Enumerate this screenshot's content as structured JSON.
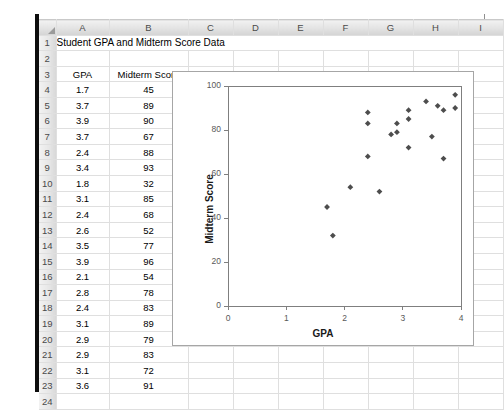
{
  "spreadsheet": {
    "column_headers": [
      "A",
      "B",
      "C",
      "D",
      "E",
      "F",
      "G",
      "H",
      "I"
    ],
    "row_headers": [
      "1",
      "2",
      "3",
      "4",
      "5",
      "6",
      "7",
      "8",
      "9",
      "10",
      "11",
      "12",
      "13",
      "14",
      "15",
      "16",
      "17",
      "18",
      "19",
      "20",
      "21",
      "22",
      "23",
      "24"
    ],
    "title_cell": "Student GPA and Midterm Score Data",
    "table_headers": [
      "GPA",
      "Midterm Score"
    ],
    "rows": [
      {
        "row": "4",
        "gpa": "1.7",
        "score": "45"
      },
      {
        "row": "5",
        "gpa": "3.7",
        "score": "89"
      },
      {
        "row": "6",
        "gpa": "3.9",
        "score": "90"
      },
      {
        "row": "7",
        "gpa": "3.7",
        "score": "67"
      },
      {
        "row": "8",
        "gpa": "2.4",
        "score": "88"
      },
      {
        "row": "9",
        "gpa": "3.4",
        "score": "93"
      },
      {
        "row": "10",
        "gpa": "1.8",
        "score": "32"
      },
      {
        "row": "11",
        "gpa": "3.1",
        "score": "85"
      },
      {
        "row": "12",
        "gpa": "2.4",
        "score": "68"
      },
      {
        "row": "13",
        "gpa": "2.6",
        "score": "52"
      },
      {
        "row": "14",
        "gpa": "3.5",
        "score": "77"
      },
      {
        "row": "15",
        "gpa": "3.9",
        "score": "96"
      },
      {
        "row": "16",
        "gpa": "2.1",
        "score": "54"
      },
      {
        "row": "17",
        "gpa": "2.8",
        "score": "78"
      },
      {
        "row": "18",
        "gpa": "2.4",
        "score": "83"
      },
      {
        "row": "19",
        "gpa": "3.1",
        "score": "89"
      },
      {
        "row": "20",
        "gpa": "2.9",
        "score": "79"
      },
      {
        "row": "21",
        "gpa": "2.9",
        "score": "83"
      },
      {
        "row": "22",
        "gpa": "3.1",
        "score": "72"
      },
      {
        "row": "23",
        "gpa": "3.6",
        "score": "91"
      }
    ]
  },
  "chart_data": {
    "type": "scatter",
    "title": "",
    "xlabel": "GPA",
    "ylabel": "Midterm Score",
    "xlim": [
      0,
      4
    ],
    "ylim": [
      0,
      100
    ],
    "xticks": [
      "0",
      "1",
      "2",
      "3",
      "4"
    ],
    "yticks": [
      "0",
      "20",
      "40",
      "60",
      "80",
      "100"
    ],
    "grid": false,
    "legend": "none",
    "marker": "diamond",
    "marker_color": "#4d4d4d",
    "points": [
      {
        "x": 1.7,
        "y": 45
      },
      {
        "x": 3.7,
        "y": 89
      },
      {
        "x": 3.9,
        "y": 90
      },
      {
        "x": 3.7,
        "y": 67
      },
      {
        "x": 2.4,
        "y": 88
      },
      {
        "x": 3.4,
        "y": 93
      },
      {
        "x": 1.8,
        "y": 32
      },
      {
        "x": 3.1,
        "y": 85
      },
      {
        "x": 2.4,
        "y": 68
      },
      {
        "x": 2.6,
        "y": 52
      },
      {
        "x": 3.5,
        "y": 77
      },
      {
        "x": 3.9,
        "y": 96
      },
      {
        "x": 2.1,
        "y": 54
      },
      {
        "x": 2.8,
        "y": 78
      },
      {
        "x": 2.4,
        "y": 83
      },
      {
        "x": 3.1,
        "y": 89
      },
      {
        "x": 2.9,
        "y": 79
      },
      {
        "x": 2.9,
        "y": 83
      },
      {
        "x": 3.1,
        "y": 72
      },
      {
        "x": 3.6,
        "y": 91
      }
    ]
  }
}
